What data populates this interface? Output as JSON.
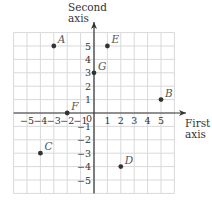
{
  "chart_data": {
    "type": "scatter",
    "title": "",
    "xlabel": "First axis",
    "ylabel": "Second axis",
    "xlabel_lines": [
      "First",
      "axis"
    ],
    "ylabel_lines": [
      "Second",
      "axis"
    ],
    "xlim": [
      -6,
      6
    ],
    "ylim": [
      -6,
      6
    ],
    "grid": true,
    "x_ticks": [
      -5,
      -4,
      -3,
      -2,
      -1,
      1,
      2,
      3,
      4,
      5
    ],
    "y_ticks": [
      -5,
      -4,
      -3,
      -2,
      -1,
      1,
      2,
      3,
      4,
      5
    ],
    "origin_label": "0",
    "points": [
      {
        "label": "A",
        "x": -3,
        "y": 5
      },
      {
        "label": "B",
        "x": 5,
        "y": 1
      },
      {
        "label": "C",
        "x": -4,
        "y": -3
      },
      {
        "label": "D",
        "x": 2,
        "y": -4
      },
      {
        "label": "E",
        "x": 1,
        "y": 5
      },
      {
        "label": "F",
        "x": -2,
        "y": 0
      },
      {
        "label": "G",
        "x": 0,
        "y": 3
      }
    ]
  },
  "colors": {
    "grid": "#d9d9d9",
    "axis": "#333333",
    "point": "#333333",
    "point_label": "#555555",
    "tick_label": "#333333"
  }
}
